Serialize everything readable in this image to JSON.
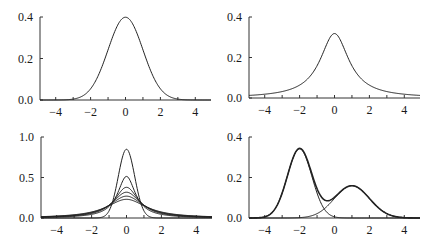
{
  "chart_data": [
    {
      "type": "line",
      "title": "",
      "xlabel": "",
      "ylabel": "",
      "xlim": [
        -4.9,
        4.9
      ],
      "ylim": [
        0,
        0.4
      ],
      "xticks": [
        -4,
        -3,
        -2,
        -1,
        0,
        1,
        2,
        3,
        4
      ],
      "xtick_labels": [
        "-4",
        "-2",
        "0",
        "2",
        "4"
      ],
      "xtick_label_values": [
        -4,
        -2,
        0,
        2,
        4
      ],
      "yticks": [
        0,
        0.2,
        0.4
      ],
      "ytick_labels": [
        "0.0",
        "0.2",
        "0.4"
      ],
      "series": [
        {
          "name": "normal",
          "dist": "normal",
          "mu": 0,
          "sigma": 1,
          "weight": 1,
          "style": "thin"
        }
      ],
      "grid": false
    },
    {
      "type": "line",
      "title": "",
      "xlabel": "",
      "ylabel": "",
      "xlim": [
        -4.9,
        4.9
      ],
      "ylim": [
        0,
        0.4
      ],
      "xticks": [
        -4,
        -3,
        -2,
        -1,
        0,
        1,
        2,
        3,
        4
      ],
      "xtick_labels": [
        "-4",
        "-2",
        "0",
        "2",
        "4"
      ],
      "xtick_label_values": [
        -4,
        -2,
        0,
        2,
        4
      ],
      "yticks": [
        0,
        0.2,
        0.4
      ],
      "ytick_labels": [
        "0.0",
        "0.2",
        "0.4"
      ],
      "series": [
        {
          "name": "cauchy",
          "dist": "cauchy",
          "mu": 0,
          "sigma": 1,
          "weight": 1,
          "style": "thin"
        }
      ],
      "grid": false
    },
    {
      "type": "line",
      "title": "",
      "xlabel": "",
      "ylabel": "",
      "xlim": [
        -4.9,
        4.9
      ],
      "ylim": [
        0,
        1.0
      ],
      "xticks": [
        -4,
        -3,
        -2,
        -1,
        0,
        1,
        2,
        3,
        4
      ],
      "xtick_labels": [
        "-4",
        "-2",
        "0",
        "2",
        "4"
      ],
      "xtick_label_values": [
        -4,
        -2,
        0,
        2,
        4
      ],
      "yticks": [
        0,
        0.5,
        1.0
      ],
      "ytick_labels": [
        "0.0",
        "0.5",
        "1.0"
      ],
      "series": [
        {
          "name": "peak-0.85",
          "dist": "normal",
          "mu": 0,
          "sigma": 0.47,
          "weight": 1,
          "style": "thin"
        },
        {
          "name": "peak-0.51",
          "dist": "cauchy",
          "mu": 0,
          "sigma": 0.62,
          "weight": 1,
          "style": "thin"
        },
        {
          "name": "peak-0.38",
          "dist": "cauchy",
          "mu": 0,
          "sigma": 0.84,
          "weight": 1,
          "style": "thin"
        },
        {
          "name": "peak-0.32",
          "dist": "cauchy",
          "mu": 0,
          "sigma": 1.0,
          "weight": 1,
          "style": "thin"
        },
        {
          "name": "peak-0.27",
          "dist": "cauchy",
          "mu": 0,
          "sigma": 1.18,
          "weight": 1,
          "style": "thin"
        },
        {
          "name": "peak-0.23",
          "dist": "cauchy",
          "mu": 0,
          "sigma": 1.38,
          "weight": 1,
          "style": "thin"
        }
      ],
      "grid": false
    },
    {
      "type": "line",
      "title": "",
      "xlabel": "",
      "ylabel": "",
      "xlim": [
        -4.9,
        4.9
      ],
      "ylim": [
        0,
        0.4
      ],
      "xticks": [
        -4,
        -3,
        -2,
        -1,
        0,
        1,
        2,
        3,
        4
      ],
      "xtick_labels": [
        "-4",
        "-2",
        "0",
        "2",
        "4"
      ],
      "xtick_label_values": [
        -4,
        -2,
        0,
        2,
        4
      ],
      "yticks": [
        0,
        0.2,
        0.4
      ],
      "ytick_labels": [
        "0.0",
        "0.2",
        "0.4"
      ],
      "series": [
        {
          "name": "component-1",
          "dist": "normal",
          "mu": -2,
          "sigma": 0.7,
          "weight": 0.6,
          "style": "thin"
        },
        {
          "name": "component-2",
          "dist": "normal",
          "mu": 1,
          "sigma": 1.0,
          "weight": 0.4,
          "style": "thin"
        },
        {
          "name": "mixture",
          "dist": "mixture",
          "components": [
            0,
            1
          ],
          "style": "bold"
        }
      ],
      "grid": false
    }
  ]
}
